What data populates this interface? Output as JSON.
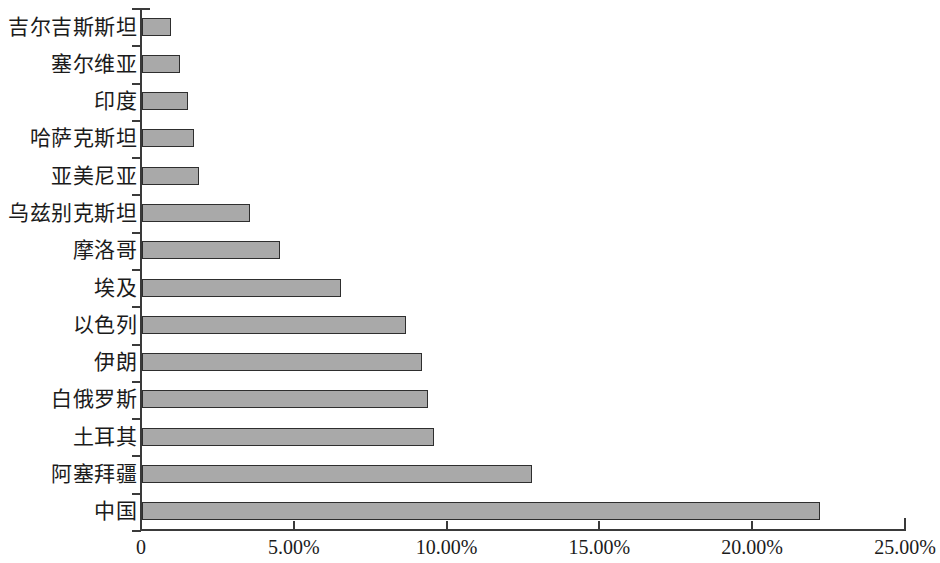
{
  "chart_data": {
    "type": "bar",
    "orientation": "horizontal",
    "title": "",
    "subtitle": "",
    "xlabel": "",
    "ylabel": "",
    "xlim": [
      0,
      25
    ],
    "grid": false,
    "legend": null,
    "value_format": "percent",
    "xticks": [
      {
        "value": 0,
        "label": "0"
      },
      {
        "value": 5,
        "label": "5.00%"
      },
      {
        "value": 10,
        "label": "10.00%"
      },
      {
        "value": 15,
        "label": "15.00%"
      },
      {
        "value": 20,
        "label": "20.00%"
      },
      {
        "value": 25,
        "label": "25.00%"
      }
    ],
    "categories": [
      "吉尔吉斯斯坦",
      "塞尔维亚",
      "印度",
      "哈萨克斯坦",
      "亚美尼亚",
      "乌兹别克斯坦",
      "摩洛哥",
      "埃及",
      "以色列",
      "伊朗",
      "白俄罗斯",
      "土耳其",
      "阿塞拜疆",
      "中国"
    ],
    "values": [
      0.95,
      1.25,
      1.5,
      1.7,
      1.85,
      3.55,
      4.5,
      6.5,
      8.65,
      9.15,
      9.35,
      9.55,
      12.75,
      22.2
    ],
    "bar_color": "#a9a9a9",
    "bar_border_color": "#2e2e2e",
    "axis_color": "#3a3a3a"
  }
}
